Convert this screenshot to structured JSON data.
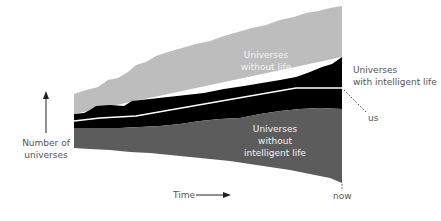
{
  "diagram": {
    "regions": {
      "without_life": {
        "label_line1": "Universes",
        "label_line2": "without life",
        "color": "#bdbdbd"
      },
      "with_intelligent_life": {
        "label_line1": "Universes",
        "label_line2": "with intelligent life",
        "color": "#000000"
      },
      "without_intelligent_life": {
        "label_line1": "Universes",
        "label_line2": "without",
        "label_line3": "intelligent life",
        "color": "#5c5c5c"
      }
    },
    "us_line": {
      "label": "us",
      "color": "#ffffff"
    },
    "y_axis": {
      "label_line1": "Number of",
      "label_line2": "universes"
    },
    "x_axis": {
      "label": "Time"
    },
    "now_marker": {
      "label": "now"
    }
  }
}
